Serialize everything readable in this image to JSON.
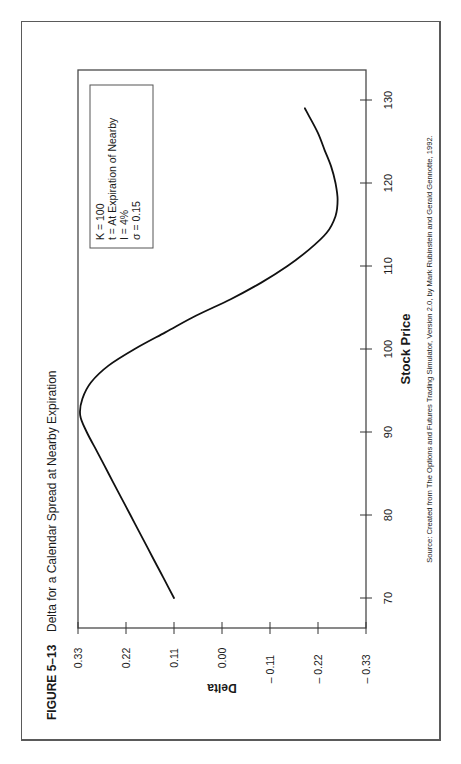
{
  "figure": {
    "label": "FIGURE 5–13",
    "title": "Delta for a Calendar Spread at Nearby Expiration",
    "source": "Source: Created from The Options and Futures Trading Simulator, Version 2.0, by Mark Rubinstein and Gerald Gennotte, 1992."
  },
  "legend": {
    "lines": [
      "K = 100",
      "t = At Expiration of Nearby",
      "I = 4%",
      "σ = 0.15"
    ]
  },
  "axes": {
    "xlabel": "Stock Price",
    "ylabel": "Delta",
    "xticks": [
      "70",
      "80",
      "90",
      "100",
      "110",
      "120",
      "130"
    ],
    "yticks": [
      "0.33",
      "0.22",
      "0.11",
      "0.00",
      "– 0.11",
      "– 0.22",
      "– 0.33"
    ]
  },
  "chart_data": {
    "type": "line",
    "title": "Delta for a Calendar Spread at Nearby Expiration",
    "xlabel": "Stock Price",
    "ylabel": "Delta",
    "xlim": [
      66.4,
      133.5
    ],
    "ylim": [
      -0.33,
      0.33
    ],
    "xticks": [
      70,
      80,
      90,
      100,
      110,
      120,
      130
    ],
    "yticks": [
      0.33,
      0.22,
      0.11,
      0.0,
      -0.11,
      -0.22,
      -0.33
    ],
    "grid": false,
    "legend_position": "upper-left (inside plot)",
    "orientation": "rotated 90° counter-clockwise on page",
    "annotations": [
      "K = 100",
      "t = At Expiration of Nearby",
      "I = 4%",
      "σ = 0.15"
    ],
    "series": [
      {
        "name": "Delta",
        "x": [
          70,
          72,
          74,
          76,
          78,
          80,
          82,
          84,
          86,
          88,
          90,
          92,
          94,
          96,
          98,
          100,
          102,
          104,
          106,
          108,
          110,
          112,
          114,
          116,
          118,
          120,
          122,
          124,
          126,
          128,
          129
        ],
        "y": [
          0.11,
          0.13,
          0.15,
          0.17,
          0.19,
          0.21,
          0.23,
          0.25,
          0.27,
          0.29,
          0.31,
          0.325,
          0.32,
          0.3,
          0.26,
          0.2,
          0.13,
          0.06,
          -0.02,
          -0.09,
          -0.15,
          -0.2,
          -0.24,
          -0.26,
          -0.265,
          -0.26,
          -0.25,
          -0.235,
          -0.22,
          -0.2,
          -0.19
        ]
      }
    ]
  }
}
